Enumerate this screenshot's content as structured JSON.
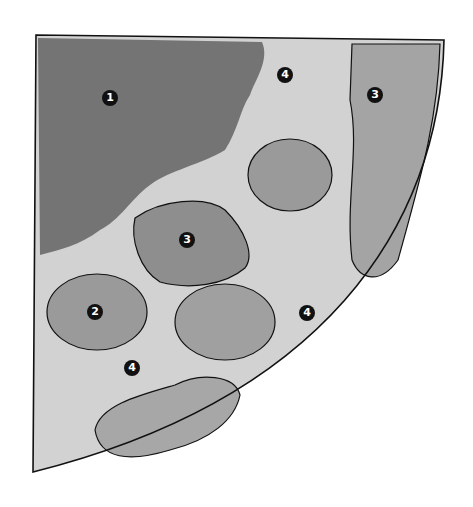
{
  "diagram": {
    "type": "garden-plan-quarter-circle",
    "style": "grayscale watercolor",
    "colors": {
      "outline": "#111111",
      "region_dark": "#6f6f6f",
      "region_mid": "#8e8e8e",
      "region_light": "#b3b3b3",
      "ground": "#d6d6d6",
      "marker_fill": "#111111",
      "marker_text": "#ffffff"
    },
    "markers": [
      {
        "label": "1",
        "x": 110,
        "y": 98
      },
      {
        "label": "4",
        "x": 285,
        "y": 75
      },
      {
        "label": "3",
        "x": 375,
        "y": 95
      },
      {
        "label": "3",
        "x": 187,
        "y": 240
      },
      {
        "label": "2",
        "x": 95,
        "y": 312
      },
      {
        "label": "4",
        "x": 307,
        "y": 313
      },
      {
        "label": "4",
        "x": 132,
        "y": 368
      }
    ]
  }
}
